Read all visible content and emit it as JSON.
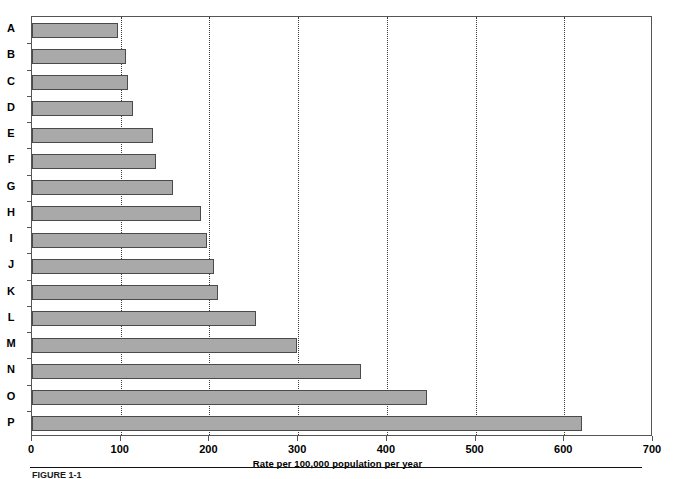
{
  "chart_data": {
    "type": "bar",
    "orientation": "horizontal",
    "title": "",
    "xlabel": "Rate per 100,000 population per year",
    "ylabel": "",
    "categories": [
      "A",
      "B",
      "C",
      "D",
      "E",
      "F",
      "G",
      "H",
      "I",
      "J",
      "K",
      "L",
      "M",
      "N",
      "O",
      "P"
    ],
    "values": [
      97,
      106,
      108,
      114,
      136,
      140,
      159,
      190,
      197,
      205,
      210,
      252,
      299,
      371,
      445,
      620
    ],
    "xlim": [
      0,
      700
    ],
    "xticks": [
      0,
      100,
      200,
      300,
      400,
      500,
      600,
      700
    ],
    "xtick_labels": [
      "0",
      "100",
      "200",
      "300",
      "400",
      "500",
      "600",
      "700"
    ],
    "gridlines_x": [
      100,
      200,
      300,
      400,
      500,
      600
    ],
    "grid": "vertical-dotted",
    "legend": "none",
    "bar_fill_color": "#a9a9a9",
    "bar_border_color": "#4a4a4a",
    "axis_color": "#555555",
    "gridline_color": "#3a3a3a"
  },
  "caption": {
    "text": "FIGURE 1-1"
  }
}
